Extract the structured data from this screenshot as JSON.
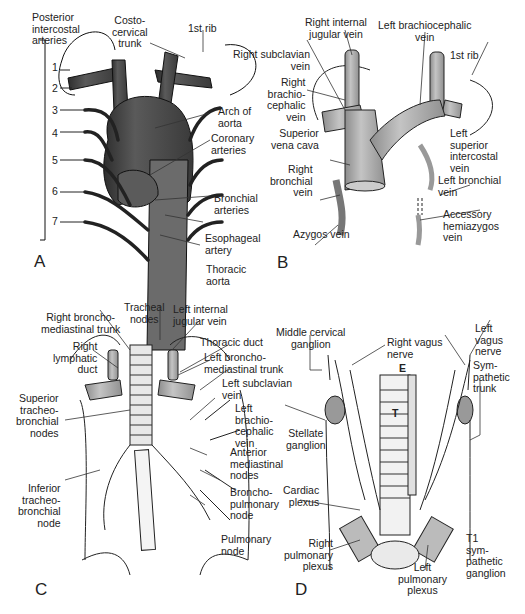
{
  "figure": {
    "panels": [
      {
        "id": "A",
        "letter": "A",
        "labels": {
          "posterior_intercostal": "Posterior\nintercostal\narteries",
          "costocervical": "Costo-\ncervical\ntrunk",
          "first_rib": "1st rib",
          "arch_aorta": "Arch of\naorta",
          "coronary": "Coronary\narteries",
          "bronchial": "Bronchial\narteries",
          "esophageal": "Esophageal\nartery",
          "thoracic_aorta": "Thoracic\naorta"
        },
        "intercostal_numbers": [
          "1",
          "2",
          "3",
          "4",
          "5",
          "6",
          "7"
        ]
      },
      {
        "id": "B",
        "letter": "B",
        "labels": {
          "right_ijv": "Right internal\njugular vein",
          "left_brachio": "Left brachiocephalic\nvein",
          "right_subclavian": "Right subclavian\nvein",
          "right_brachio": "Right\nbrachio-\ncephalic\nvein",
          "first_rib": "1st rib",
          "svc": "Superior\nvena cava",
          "left_sup_intercostal": "Left\nsuperior\nintercostal\nvein",
          "right_bronchial": "Right\nbronchial\nvein",
          "left_bronchial": "Left bronchial\nvein",
          "azygos": "Azygos vein",
          "acc_hemiazygos": "Accessory\nhemiazygos\nvein"
        }
      },
      {
        "id": "C",
        "letter": "C",
        "labels": {
          "tracheal_nodes": "Tracheal\nnodes",
          "right_bm_trunk": "Right broncho-\nmediastinal trunk",
          "left_ijv": "Left internal\njugular vein",
          "thoracic_duct": "Thoracic duct",
          "right_lymph_duct": "Right\nlymphatic\nduct",
          "left_bm_trunk": "Left broncho-\nmediastinal trunk",
          "left_subclavian": "Left subclavian\nvein",
          "sup_tb_nodes": "Superior\ntracheo-\nbronchial\nnodes",
          "left_brachio": "Left\nbrachio-\ncephalic\nvein",
          "ant_med_nodes": "Anterior\nmediastinal\nnodes",
          "inf_tb_node": "Inferior\ntracheo-\nbronchial\nnode",
          "bp_node": "Broncho-\npulmonary\nnode",
          "pulm_node": "Pulmonary\nnode"
        }
      },
      {
        "id": "D",
        "letter": "D",
        "labels": {
          "mid_cervical": "Middle cervical\nganglion",
          "right_vagus": "Right vagus\nnerve",
          "left_vagus": "Left\nvagus\nnerve",
          "symp_trunk": "Sym-\npathetic\ntrunk",
          "esophagus_mark": "E",
          "trachea_mark": "T",
          "stellate": "Stellate\nganglion",
          "cardiac": "Cardiac\nplexus",
          "right_pulm": "Right\npulmonary\nplexus",
          "left_pulm": "Left\npulmonary\nplexus",
          "t1_ganglion": "T1\nsym-\npathetic\nganglion"
        }
      }
    ],
    "colors": {
      "artery": "#4a4a4a",
      "vein": "#a8a8a8",
      "line": "#222222",
      "background": "#ffffff"
    }
  }
}
